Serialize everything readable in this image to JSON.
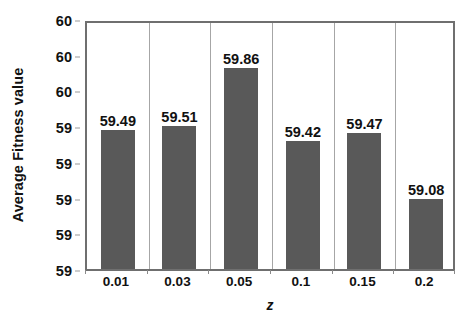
{
  "chart_data": {
    "type": "bar",
    "title": "",
    "xlabel": "z",
    "ylabel": "Average Fitness value",
    "categories": [
      "0.01",
      "0.03",
      "0.05",
      "0.1",
      "0.15",
      "0.2"
    ],
    "values": [
      59.49,
      59.51,
      59.86,
      59.42,
      59.47,
      59.08
    ],
    "data_labels": [
      "59.49",
      "59.51",
      "59.86",
      "59.42",
      "59.47",
      "59.08"
    ],
    "y_tick_labels": [
      "60",
      "60",
      "60",
      "59",
      "59",
      "59",
      "59",
      "59"
    ],
    "ylim": [
      58.66,
      60.15
    ],
    "grid": "vertical-category-separators",
    "legend": "none",
    "bar_color": "#595959",
    "axis_color": "#6f6f6f",
    "gridline_color": "#a6a6a6",
    "text_color": "#111111",
    "background_color": "#ffffff"
  }
}
